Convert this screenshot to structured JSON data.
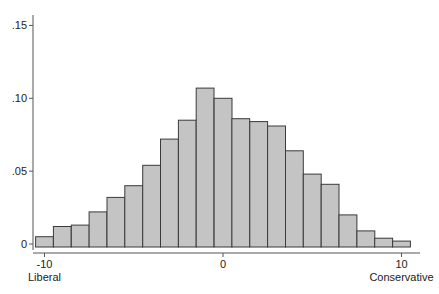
{
  "chart_data": {
    "type": "bar",
    "subtype": "histogram",
    "title": "",
    "xlabel": "",
    "ylabel": "",
    "categories": [
      -10,
      -9,
      -8,
      -7,
      -6,
      -5,
      -4,
      -3,
      -2,
      -1,
      0,
      1,
      2,
      3,
      4,
      5,
      6,
      7,
      8,
      9,
      10
    ],
    "values": [
      0.005,
      0.012,
      0.013,
      0.022,
      0.032,
      0.04,
      0.054,
      0.072,
      0.085,
      0.107,
      0.1,
      0.086,
      0.084,
      0.081,
      0.064,
      0.048,
      0.041,
      0.02,
      0.009,
      0.004,
      0.002
    ],
    "bin_width": 1,
    "xlim": [
      -10.5,
      10.5
    ],
    "ylim": [
      0,
      0.15
    ],
    "x_ticks": [
      {
        "value": -10,
        "label": "-10",
        "sublabel": "Liberal"
      },
      {
        "value": 0,
        "label": "0",
        "sublabel": ""
      },
      {
        "value": 10,
        "label": "10",
        "sublabel": "Conservative"
      }
    ],
    "y_ticks": [
      {
        "value": 0,
        "label": "0"
      },
      {
        "value": 0.05,
        "label": ".05"
      },
      {
        "value": 0.1,
        "label": ".10"
      },
      {
        "value": 0.15,
        "label": ".15"
      }
    ],
    "grid": false,
    "legend": null,
    "colors": {
      "bar_fill": "#c4c4c4",
      "bar_stroke": "#3a3a3a",
      "axis": "#555555",
      "text": "#222222"
    }
  }
}
